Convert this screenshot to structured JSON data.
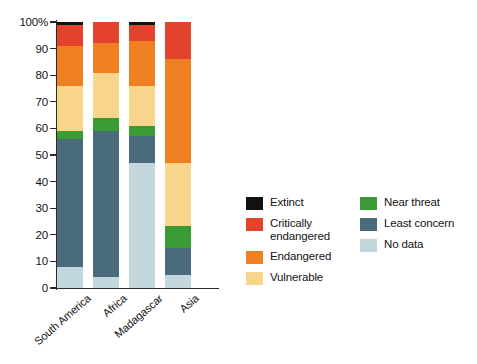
{
  "chart_data": {
    "type": "bar",
    "subtype": "stacked-bar-100-percent",
    "title": "",
    "subtitle": "",
    "xlabel": "",
    "ylabel": "",
    "ylim": [
      0,
      100
    ],
    "yticks": [
      0,
      10,
      20,
      30,
      40,
      50,
      60,
      70,
      80,
      90,
      100
    ],
    "ytick_labels": [
      "0",
      "10",
      "20",
      "30",
      "40",
      "50",
      "60",
      "70",
      "80",
      "90",
      "100%"
    ],
    "grid": false,
    "legend_position": "right",
    "categories": [
      "South America",
      "Africa",
      "Madagascar",
      "Asia"
    ],
    "series": [
      {
        "name": "No data",
        "color": "#c2d7dc",
        "values": [
          8,
          4,
          47,
          5
        ]
      },
      {
        "name": "Least concern",
        "color": "#4a6b7c",
        "values": [
          48,
          55,
          10,
          10
        ]
      },
      {
        "name": "Near threat",
        "color": "#3a9a33",
        "values": [
          3,
          5,
          4,
          8.5
        ]
      },
      {
        "name": "Vulnerable",
        "color": "#f7d58a",
        "values": [
          17,
          17,
          15,
          23.5
        ]
      },
      {
        "name": "Endangered",
        "color": "#ef8022",
        "values": [
          15,
          11,
          17,
          39
        ]
      },
      {
        "name": "Critically endangered",
        "color": "#e3432c",
        "values": [
          8,
          8,
          6,
          14
        ]
      },
      {
        "name": "Extinct",
        "color": "#111111",
        "values": [
          1,
          0,
          1,
          0
        ]
      }
    ],
    "cumulative_tops": {
      "South America": {
        "No data": 8,
        "Least concern": 56,
        "Near threat": 59,
        "Vulnerable": 76,
        "Endangered": 91,
        "Critically endangered": 99,
        "Extinct": 100
      },
      "Africa": {
        "No data": 4,
        "Least concern": 59,
        "Near threat": 64,
        "Vulnerable": 81,
        "Endangered": 92,
        "Critically endangered": 100,
        "Extinct": 100
      },
      "Madagascar": {
        "No data": 47,
        "Least concern": 57,
        "Near threat": 61,
        "Vulnerable": 76,
        "Endangered": 93,
        "Critically endangered": 99,
        "Extinct": 100
      },
      "Asia": {
        "No data": 5,
        "Least concern": 15,
        "Near threat": 23.5,
        "Vulnerable": 47,
        "Endangered": 86,
        "Critically endangered": 100,
        "Extinct": 100
      }
    }
  },
  "axis": {
    "y_tick_labels": [
      "100%",
      "90",
      "80",
      "70",
      "60",
      "50",
      "40",
      "30",
      "20",
      "10",
      "0"
    ],
    "x_tick_labels": [
      "South America",
      "Africa",
      "Madagascar",
      "Asia"
    ]
  },
  "legend": {
    "left_column": [
      {
        "label": "Extinct",
        "color": "#111111"
      },
      {
        "label": "Critically\nendangered",
        "color": "#e3432c"
      },
      {
        "label": "Endangered",
        "color": "#ef8022"
      },
      {
        "label": "Vulnerable",
        "color": "#f7d58a"
      }
    ],
    "right_column": [
      {
        "label": "Near threat",
        "color": "#3a9a33"
      },
      {
        "label": "Least concern",
        "color": "#4a6b7c"
      },
      {
        "label": "No data",
        "color": "#c2d7dc"
      }
    ]
  },
  "colors": {
    "extinct": "#111111",
    "critically_endangered": "#e3432c",
    "endangered": "#ef8022",
    "vulnerable": "#f7d58a",
    "near_threat": "#3a9a33",
    "least_concern": "#4a6b7c",
    "no_data": "#c2d7dc",
    "axis": "#2b2b2b",
    "background": "#ffffff"
  }
}
